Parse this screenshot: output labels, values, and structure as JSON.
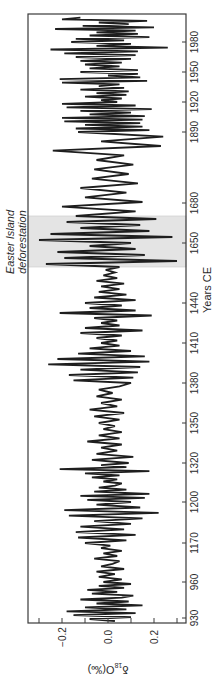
{
  "chart_data": {
    "type": "line",
    "orientation": "rotated-90-clockwise",
    "title": "",
    "xlabel": "Years CE",
    "ylabel": "δ18O(‰)",
    "ylabel_parts": {
      "delta": "δ",
      "sup": "18",
      "rest": "O(‰)"
    },
    "ylim": [
      -0.33,
      0.33
    ],
    "yticks": [
      -0.2,
      0.0,
      0.2
    ],
    "ytick_labels": [
      "−0.2",
      "0.0",
      "0.2"
    ],
    "yminor_ticks": [
      -0.3,
      -0.1,
      0.1,
      0.3
    ],
    "xtick_labels": [
      "930",
      "960",
      "1170",
      "1200",
      "1320",
      "1350",
      "1380",
      "1410",
      "1440",
      "1650",
      "1680",
      "1890",
      "1920",
      "1950",
      "1980"
    ],
    "x_axis_note": "Non-linear / broken year axis; tick labels as printed",
    "grid": false,
    "legend": null,
    "shaded_region": {
      "label_line1": "Easter Island",
      "label_line2": "deforestation",
      "from_label": "~1620",
      "to_label": "~1670",
      "color": "#e4e4e4"
    },
    "series": [
      {
        "name": "δ18O",
        "color": "#1e1e1e",
        "segments": [
          {
            "from": "930",
            "to": "960",
            "amplitude": 0.16,
            "points": [
              0.03,
              -0.08,
              0.1,
              -0.15,
              0.12,
              -0.18,
              0.08,
              -0.1,
              0.15,
              -0.05,
              0.09,
              -0.12,
              0.06,
              0.11,
              -0.07,
              0.04,
              -0.09,
              0.07,
              -0.04,
              0.1
            ]
          },
          {
            "from": "960",
            "to": "1170",
            "amplitude": 0.09,
            "points": [
              -0.02,
              0.06,
              -0.04,
              0.03,
              -0.05,
              0.07,
              -0.03,
              0.02,
              0.05,
              -0.06,
              0.04,
              -0.02,
              0.06,
              -0.03,
              0.01
            ]
          },
          {
            "from": "1170",
            "to": "1200",
            "amplitude": 0.19,
            "points": [
              -0.1,
              0.08,
              -0.13,
              0.12,
              -0.14,
              0.07,
              -0.12,
              0.1,
              -0.06,
              0.15,
              -0.17,
              0.22,
              -0.19,
              0.14,
              -0.05
            ]
          },
          {
            "from": "1200",
            "to": "1320",
            "amplitude": 0.17,
            "points": [
              0.1,
              -0.09,
              0.16,
              -0.12,
              0.18,
              -0.06,
              0.08,
              -0.04,
              0.03,
              0.06,
              -0.02,
              0.04,
              -0.07,
              0.05,
              -0.1,
              0.18,
              -0.21,
              0.08,
              -0.03
            ]
          },
          {
            "from": "1320",
            "to": "1350",
            "amplitude": 0.14,
            "points": [
              0.09,
              -0.07,
              0.11,
              -0.05,
              0.04,
              -0.03,
              0.06,
              -0.09,
              0.05,
              -0.04,
              0.06,
              -0.02,
              0.03
            ]
          },
          {
            "from": "1350",
            "to": "1380",
            "amplitude": 0.1,
            "points": [
              -0.04,
              0.05,
              -0.06,
              0.07,
              -0.08,
              0.04,
              -0.03,
              0.06,
              -0.05,
              0.02,
              -0.04,
              0.05
            ]
          },
          {
            "from": "1380",
            "to": "1410",
            "amplitude": 0.26,
            "points": [
              0.1,
              -0.15,
              0.11,
              -0.17,
              0.13,
              -0.12,
              0.14,
              -0.26,
              0.18,
              -0.22,
              0.16,
              -0.13,
              0.1,
              -0.08,
              0.05
            ]
          },
          {
            "from": "1410",
            "to": "1440",
            "amplitude": 0.2,
            "points": [
              -0.03,
              0.04,
              -0.05,
              0.06,
              -0.12,
              0.15,
              -0.1,
              0.05,
              -0.03,
              0.04,
              -0.06,
              0.19,
              -0.21,
              0.12,
              -0.08,
              0.06
            ]
          },
          {
            "from": "1440",
            "to": "1620",
            "amplitude": 0.12,
            "points": [
              -0.1,
              0.12,
              -0.06,
              0.08,
              -0.04,
              0.05,
              -0.03,
              0.07,
              -0.05,
              0.04,
              -0.02,
              0.03,
              -0.01
            ]
          },
          {
            "from": "1620",
            "to": "1670",
            "amplitude": 0.3,
            "points": [
              0.05,
              -0.27,
              0.3,
              -0.19,
              0.16,
              -0.22,
              0.12,
              -0.08,
              0.1,
              -0.3,
              0.28,
              -0.25,
              0.18,
              -0.12,
              0.14,
              -0.18,
              0.21
            ]
          },
          {
            "from": "1670",
            "to": "1890",
            "amplitude": 0.23,
            "points": [
              -0.14,
              0.12,
              -0.2,
              0.15,
              -0.1,
              0.08,
              -0.12,
              0.13,
              -0.07,
              0.09,
              -0.06,
              0.11,
              -0.05,
              0.07,
              -0.24,
              0.23,
              -0.03,
              0.24
            ]
          },
          {
            "from": "1890",
            "to": "1920",
            "amplitude": 0.2,
            "points": [
              -0.13,
              0.18,
              -0.14,
              0.15,
              -0.1,
              0.14,
              -0.19,
              0.15,
              -0.2,
              0.16,
              -0.08,
              0.1,
              -0.12,
              0.19,
              -0.18,
              0.12,
              -0.2
            ]
          },
          {
            "from": "1920",
            "to": "1950",
            "amplitude": 0.21,
            "points": [
              0.04,
              -0.03,
              0.06,
              -0.1,
              0.08,
              -0.05,
              0.09,
              -0.12,
              0.07,
              -0.04,
              0.05,
              -0.2,
              0.17,
              -0.21,
              0.14,
              0.0,
              0.13
            ]
          },
          {
            "from": "1950",
            "to": "1980",
            "amplitude": 0.26,
            "points": [
              -0.12,
              0.13,
              -0.08,
              0.05,
              -0.1,
              0.06,
              -0.12,
              0.1,
              -0.14,
              0.12,
              -0.19,
              0.13,
              -0.25,
              0.26,
              -0.05,
              0.1
            ]
          },
          {
            "from": "1980",
            "to": "end",
            "amplitude": 0.24,
            "points": [
              -0.16,
              0.07,
              -0.14,
              0.18,
              -0.08,
              0.13,
              -0.05,
              0.12,
              -0.23,
              0.2,
              -0.11,
              0.09,
              -0.04,
              0.17,
              -0.2,
              -0.12
            ]
          }
        ]
      }
    ]
  },
  "layout_map": {
    "frame": {
      "left": 28,
      "right": 186,
      "top": 14,
      "bottom": 623
    },
    "zero_x": 108,
    "px_per_unit": 230,
    "year_tick_y": {
      "1980": 42,
      "1950": 72,
      "1920": 102,
      "1890": 132,
      "1680": 203,
      "1650": 243,
      "1440": 303,
      "1410": 343,
      "1380": 383,
      "1350": 423,
      "1320": 463,
      "1200": 502,
      "1170": 543,
      "960": 582,
      "930": 618
    },
    "segment_y": {
      "930": 621,
      "960": 582,
      "1170": 543,
      "1200": 502,
      "1320": 463,
      "1350": 423,
      "1380": 383,
      "1410": 343,
      "1440": 303,
      "1620": 267,
      "1670": 216,
      "1890": 132,
      "1920": 102,
      "1950": 72,
      "1980": 42,
      "end": 16
    },
    "shade_y": [
      216,
      267
    ]
  }
}
